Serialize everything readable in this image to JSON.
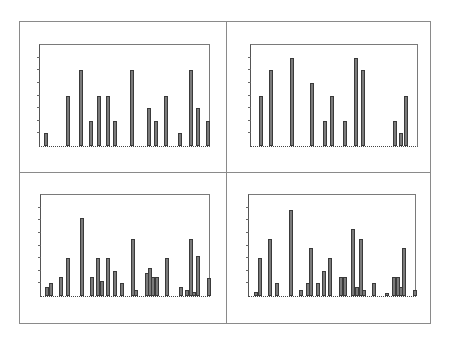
{
  "chart_data": [
    {
      "id": "top-left",
      "type": "bar",
      "title": "",
      "xlabel": "",
      "ylabel": "",
      "ylim": [
        0,
        8
      ],
      "yticks": 8,
      "grid": false,
      "legend": null,
      "plot_box": {
        "left": 39,
        "top": 44,
        "width": 171,
        "height": 103
      },
      "x": [
        45,
        67,
        80,
        90,
        98,
        107,
        114,
        131,
        148,
        155,
        165,
        179,
        190,
        197,
        207
      ],
      "values": [
        1,
        4,
        6,
        2,
        4,
        4,
        2,
        6,
        3,
        2,
        4,
        1,
        6,
        3,
        2
      ]
    },
    {
      "id": "top-right",
      "type": "bar",
      "title": "",
      "xlabel": "",
      "ylabel": "",
      "ylim": [
        0,
        8
      ],
      "yticks": 8,
      "grid": false,
      "legend": null,
      "plot_box": {
        "left": 250,
        "top": 44,
        "width": 168,
        "height": 103
      },
      "x": [
        260,
        270,
        291,
        311,
        324,
        331,
        344,
        355,
        362,
        394,
        400,
        405
      ],
      "values": [
        4,
        6,
        7,
        5,
        2,
        4,
        2,
        7,
        6,
        2,
        1,
        4
      ]
    },
    {
      "id": "bottom-left",
      "type": "bar",
      "title": "",
      "xlabel": "",
      "ylabel": "",
      "ylim": [
        0,
        8
      ],
      "yticks": 8,
      "grid": false,
      "legend": null,
      "plot_box": {
        "left": 40,
        "top": 194,
        "width": 170,
        "height": 103
      },
      "x": [
        46,
        50,
        60,
        67,
        81,
        91,
        97,
        101,
        107,
        114,
        121,
        132,
        135,
        146,
        149,
        152,
        156,
        166,
        180,
        186,
        190,
        193,
        197,
        208
      ],
      "values": [
        0.7,
        1,
        1.5,
        3,
        6.2,
        1.5,
        3,
        1.2,
        3,
        2,
        1,
        4.5,
        0.5,
        1.8,
        2.2,
        1.5,
        1.5,
        3,
        0.7,
        0.5,
        4.5,
        0.3,
        3.2,
        1.4
      ]
    },
    {
      "id": "bottom-right",
      "type": "bar",
      "title": "",
      "xlabel": "",
      "ylabel": "",
      "ylim": [
        0,
        8
      ],
      "yticks": 8,
      "grid": false,
      "legend": null,
      "plot_box": {
        "left": 248,
        "top": 194,
        "width": 168,
        "height": 103
      },
      "x": [
        255,
        259,
        269,
        276,
        290,
        300,
        307,
        310,
        317,
        323,
        329,
        340,
        344,
        352,
        356,
        360,
        363,
        373,
        386,
        393,
        397,
        400,
        403,
        414
      ],
      "values": [
        0.3,
        3,
        4.5,
        1,
        6.8,
        0.5,
        1,
        3.8,
        1,
        2,
        3,
        1.5,
        1.5,
        5.3,
        0.7,
        4.5,
        0.5,
        1,
        0.2,
        1.5,
        1.5,
        0.7,
        3.8,
        0.5
      ]
    }
  ],
  "colors": {
    "bar_fill": "#7a7a7a",
    "bar_edge": "#3a3a3a",
    "frame": "#8a8a8a"
  }
}
